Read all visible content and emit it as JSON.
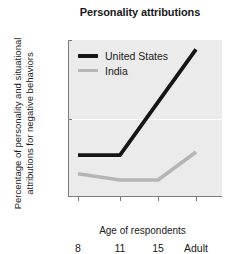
{
  "chart_data": {
    "type": "line",
    "title": "Personality attributions",
    "xlabel": "Age of respondents",
    "ylabel_line1": "Percentage of personality and situational",
    "ylabel_line2": "attributions for negative behaviors",
    "categories": [
      "8",
      "11",
      "15",
      "Adult"
    ],
    "series": [
      {
        "name": "United States",
        "color": "#151515",
        "values": [
          13,
          13,
          30,
          47
        ]
      },
      {
        "name": "India",
        "color": "#b5b5b5",
        "values": [
          7,
          5,
          5,
          14
        ]
      }
    ],
    "yticks": [
      "0",
      "25",
      "50"
    ],
    "ylim": [
      0,
      50
    ],
    "grid": "horizontal-white-at-25",
    "legend_position": "top-left-inside",
    "plot_background": "#ebebeb"
  },
  "legend": {
    "entries": [
      {
        "label": "United States"
      },
      {
        "label": "India"
      }
    ]
  },
  "caption": {
    "text": ""
  }
}
